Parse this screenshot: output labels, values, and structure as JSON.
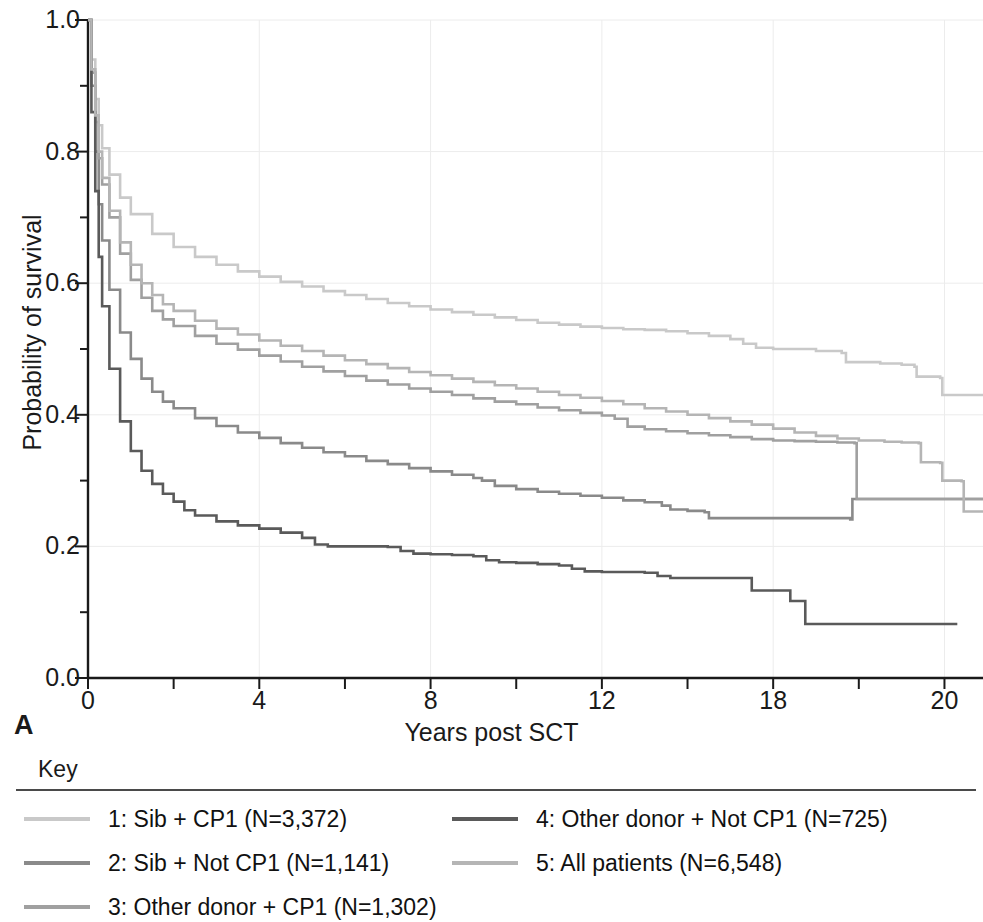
{
  "panel": {
    "label": "A"
  },
  "key": {
    "title": "Key"
  },
  "axes": {
    "xlabel": "Years post SCT",
    "ylabel": "Probability of survival",
    "xticks": [
      {
        "value": 0,
        "label": "0"
      },
      {
        "value": 4,
        "label": "4"
      },
      {
        "value": 8,
        "label": "8"
      },
      {
        "value": 12,
        "label": "12"
      },
      {
        "value": 16,
        "label": "18"
      },
      {
        "value": 20,
        "label": "20"
      }
    ],
    "yticks": [
      {
        "value": 0.0,
        "label": "0.0"
      },
      {
        "value": 0.2,
        "label": "0.2"
      },
      {
        "value": 0.4,
        "label": "0.4"
      },
      {
        "value": 0.6,
        "label": "0.6"
      },
      {
        "value": 0.8,
        "label": "0.8"
      },
      {
        "value": 1.0,
        "label": "1.0"
      }
    ],
    "xminor_step": 2,
    "yminor_step": 0.1
  },
  "chart_data": {
    "type": "line",
    "title": "",
    "subtitle": "",
    "xlabel": "Years post SCT",
    "ylabel": "Probability of survival",
    "xlim": [
      0,
      20.9
    ],
    "ylim": [
      0.0,
      1.0
    ],
    "grid": true,
    "grid_color": "#ececec",
    "legend_position": "below",
    "annotations": [
      "A"
    ],
    "series": [
      {
        "id": 1,
        "name": "1: Sib + CP1 (N=3,372)",
        "group": "Sib + CP1",
        "n": 3372,
        "color": "#c9c9c9",
        "points": [
          [
            0,
            1.0
          ],
          [
            0.08,
            0.94
          ],
          [
            0.17,
            0.88
          ],
          [
            0.25,
            0.84
          ],
          [
            0.33,
            0.805
          ],
          [
            0.5,
            0.765
          ],
          [
            0.75,
            0.73
          ],
          [
            1.0,
            0.705
          ],
          [
            1.5,
            0.675
          ],
          [
            2.0,
            0.655
          ],
          [
            2.5,
            0.64
          ],
          [
            3.0,
            0.628
          ],
          [
            3.5,
            0.618
          ],
          [
            4.0,
            0.61
          ],
          [
            4.5,
            0.602
          ],
          [
            5.0,
            0.595
          ],
          [
            5.5,
            0.588
          ],
          [
            6.0,
            0.582
          ],
          [
            6.5,
            0.576
          ],
          [
            7.0,
            0.57
          ],
          [
            7.5,
            0.565
          ],
          [
            8.0,
            0.56
          ],
          [
            8.5,
            0.556
          ],
          [
            9.0,
            0.552
          ],
          [
            9.5,
            0.548
          ],
          [
            10.0,
            0.544
          ],
          [
            10.5,
            0.54
          ],
          [
            11.0,
            0.537
          ],
          [
            11.5,
            0.534
          ],
          [
            12.0,
            0.532
          ],
          [
            12.5,
            0.53
          ],
          [
            13.0,
            0.529
          ],
          [
            13.5,
            0.527
          ],
          [
            14.0,
            0.524
          ],
          [
            14.5,
            0.52
          ],
          [
            15.0,
            0.515
          ],
          [
            15.3,
            0.508
          ],
          [
            15.6,
            0.502
          ],
          [
            16.0,
            0.5
          ],
          [
            17.0,
            0.497
          ],
          [
            17.6,
            0.494
          ],
          [
            17.7,
            0.48
          ],
          [
            18.5,
            0.478
          ],
          [
            19.0,
            0.476
          ],
          [
            19.3,
            0.473
          ],
          [
            19.35,
            0.458
          ],
          [
            19.9,
            0.456
          ],
          [
            19.95,
            0.43
          ],
          [
            20.9,
            0.43
          ]
        ]
      },
      {
        "id": 2,
        "name": "2: Sib + Not CP1 (N=1,141)",
        "group": "Sib + Not CP1",
        "n": 1141,
        "color": "#8a8a8a",
        "points": [
          [
            0,
            1.0
          ],
          [
            0.08,
            0.9
          ],
          [
            0.17,
            0.8
          ],
          [
            0.25,
            0.72
          ],
          [
            0.33,
            0.665
          ],
          [
            0.5,
            0.59
          ],
          [
            0.75,
            0.525
          ],
          [
            1.0,
            0.485
          ],
          [
            1.25,
            0.455
          ],
          [
            1.5,
            0.435
          ],
          [
            1.75,
            0.42
          ],
          [
            2.0,
            0.41
          ],
          [
            2.5,
            0.395
          ],
          [
            3.0,
            0.383
          ],
          [
            3.5,
            0.373
          ],
          [
            4.0,
            0.365
          ],
          [
            4.5,
            0.357
          ],
          [
            5.0,
            0.35
          ],
          [
            5.5,
            0.343
          ],
          [
            6.0,
            0.337
          ],
          [
            6.5,
            0.33
          ],
          [
            7.0,
            0.325
          ],
          [
            7.5,
            0.319
          ],
          [
            8.0,
            0.314
          ],
          [
            8.5,
            0.309
          ],
          [
            9.0,
            0.304
          ],
          [
            9.2,
            0.3
          ],
          [
            9.5,
            0.292
          ],
          [
            10.0,
            0.287
          ],
          [
            10.5,
            0.283
          ],
          [
            11.0,
            0.28
          ],
          [
            11.5,
            0.277
          ],
          [
            12.0,
            0.274
          ],
          [
            12.5,
            0.27
          ],
          [
            13.0,
            0.267
          ],
          [
            13.4,
            0.262
          ],
          [
            13.6,
            0.256
          ],
          [
            14.0,
            0.254
          ],
          [
            14.4,
            0.252
          ],
          [
            14.5,
            0.243
          ],
          [
            17.8,
            0.241
          ],
          [
            17.85,
            0.272
          ],
          [
            17.9,
            0.272
          ],
          [
            20.9,
            0.272
          ]
        ]
      },
      {
        "id": 3,
        "name": "3: Other donor + CP1 (N=1,302)",
        "group": "Other donor + CP1",
        "n": 1302,
        "color": "#a0a0a0",
        "points": [
          [
            0,
            1.0
          ],
          [
            0.08,
            0.92
          ],
          [
            0.17,
            0.845
          ],
          [
            0.25,
            0.79
          ],
          [
            0.33,
            0.75
          ],
          [
            0.5,
            0.7
          ],
          [
            0.75,
            0.645
          ],
          [
            1.0,
            0.605
          ],
          [
            1.25,
            0.578
          ],
          [
            1.5,
            0.558
          ],
          [
            1.75,
            0.545
          ],
          [
            2.0,
            0.535
          ],
          [
            2.5,
            0.52
          ],
          [
            3.0,
            0.508
          ],
          [
            3.5,
            0.499
          ],
          [
            4.0,
            0.49
          ],
          [
            4.5,
            0.481
          ],
          [
            5.0,
            0.473
          ],
          [
            5.5,
            0.466
          ],
          [
            6.0,
            0.459
          ],
          [
            6.5,
            0.452
          ],
          [
            7.0,
            0.446
          ],
          [
            7.5,
            0.44
          ],
          [
            8.0,
            0.435
          ],
          [
            8.5,
            0.43
          ],
          [
            9.0,
            0.425
          ],
          [
            9.5,
            0.42
          ],
          [
            10.0,
            0.416
          ],
          [
            10.5,
            0.411
          ],
          [
            11.0,
            0.407
          ],
          [
            11.5,
            0.403
          ],
          [
            12.0,
            0.399
          ],
          [
            12.3,
            0.394
          ],
          [
            12.6,
            0.382
          ],
          [
            13.0,
            0.378
          ],
          [
            13.5,
            0.375
          ],
          [
            14.0,
            0.372
          ],
          [
            14.5,
            0.369
          ],
          [
            15.0,
            0.366
          ],
          [
            15.5,
            0.363
          ],
          [
            16.0,
            0.361
          ],
          [
            16.5,
            0.36
          ],
          [
            17.0,
            0.359
          ],
          [
            17.5,
            0.358
          ],
          [
            17.9,
            0.357
          ],
          [
            17.95,
            0.272
          ],
          [
            18.5,
            0.272
          ],
          [
            20.3,
            0.272
          ],
          [
            20.9,
            0.272
          ]
        ]
      },
      {
        "id": 4,
        "name": "4: Other donor + Not CP1 (N=725)",
        "group": "Other donor + Not CP1",
        "n": 725,
        "color": "#5a5a5a",
        "points": [
          [
            0,
            1.0
          ],
          [
            0.08,
            0.86
          ],
          [
            0.17,
            0.74
          ],
          [
            0.25,
            0.64
          ],
          [
            0.33,
            0.565
          ],
          [
            0.5,
            0.47
          ],
          [
            0.75,
            0.39
          ],
          [
            1.0,
            0.345
          ],
          [
            1.25,
            0.315
          ],
          [
            1.5,
            0.295
          ],
          [
            1.75,
            0.28
          ],
          [
            2.0,
            0.268
          ],
          [
            2.25,
            0.255
          ],
          [
            2.5,
            0.247
          ],
          [
            3.0,
            0.238
          ],
          [
            3.5,
            0.232
          ],
          [
            4.0,
            0.227
          ],
          [
            4.5,
            0.221
          ],
          [
            5.0,
            0.213
          ],
          [
            5.3,
            0.203
          ],
          [
            5.6,
            0.2
          ],
          [
            6.0,
            0.2
          ],
          [
            6.5,
            0.2
          ],
          [
            7.0,
            0.199
          ],
          [
            7.3,
            0.193
          ],
          [
            7.6,
            0.189
          ],
          [
            8.0,
            0.188
          ],
          [
            8.5,
            0.187
          ],
          [
            9.0,
            0.185
          ],
          [
            9.3,
            0.179
          ],
          [
            9.6,
            0.176
          ],
          [
            10.0,
            0.175
          ],
          [
            10.5,
            0.173
          ],
          [
            11.0,
            0.171
          ],
          [
            11.3,
            0.166
          ],
          [
            11.6,
            0.162
          ],
          [
            12.0,
            0.161
          ],
          [
            12.6,
            0.161
          ],
          [
            13.0,
            0.16
          ],
          [
            13.3,
            0.155
          ],
          [
            13.6,
            0.152
          ],
          [
            14.0,
            0.152
          ],
          [
            14.5,
            0.152
          ],
          [
            15.0,
            0.152
          ],
          [
            15.4,
            0.152
          ],
          [
            15.5,
            0.133
          ],
          [
            16.3,
            0.133
          ],
          [
            16.4,
            0.117
          ],
          [
            16.7,
            0.117
          ],
          [
            16.75,
            0.082
          ],
          [
            17.5,
            0.082
          ],
          [
            19.6,
            0.082
          ],
          [
            20.3,
            0.082
          ]
        ]
      },
      {
        "id": 5,
        "name": "5: All patients (N=6,548)",
        "group": "All patients",
        "n": 6548,
        "color": "#b5b5b5",
        "points": [
          [
            0,
            1.0
          ],
          [
            0.08,
            0.925
          ],
          [
            0.17,
            0.855
          ],
          [
            0.25,
            0.8
          ],
          [
            0.33,
            0.76
          ],
          [
            0.5,
            0.71
          ],
          [
            0.75,
            0.662
          ],
          [
            1.0,
            0.628
          ],
          [
            1.25,
            0.6
          ],
          [
            1.5,
            0.582
          ],
          [
            1.75,
            0.568
          ],
          [
            2.0,
            0.558
          ],
          [
            2.5,
            0.543
          ],
          [
            3.0,
            0.531
          ],
          [
            3.5,
            0.522
          ],
          [
            4.0,
            0.513
          ],
          [
            4.5,
            0.505
          ],
          [
            5.0,
            0.497
          ],
          [
            5.5,
            0.49
          ],
          [
            6.0,
            0.483
          ],
          [
            6.5,
            0.477
          ],
          [
            7.0,
            0.471
          ],
          [
            7.5,
            0.465
          ],
          [
            8.0,
            0.46
          ],
          [
            8.5,
            0.455
          ],
          [
            9.0,
            0.45
          ],
          [
            9.5,
            0.445
          ],
          [
            10.0,
            0.44
          ],
          [
            10.5,
            0.435
          ],
          [
            11.0,
            0.43
          ],
          [
            11.5,
            0.426
          ],
          [
            12.0,
            0.421
          ],
          [
            12.5,
            0.416
          ],
          [
            13.0,
            0.41
          ],
          [
            13.5,
            0.405
          ],
          [
            14.0,
            0.4
          ],
          [
            14.5,
            0.395
          ],
          [
            15.0,
            0.39
          ],
          [
            15.5,
            0.385
          ],
          [
            16.0,
            0.379
          ],
          [
            16.5,
            0.373
          ],
          [
            17.0,
            0.368
          ],
          [
            17.5,
            0.364
          ],
          [
            18.0,
            0.361
          ],
          [
            18.6,
            0.359
          ],
          [
            19.0,
            0.358
          ],
          [
            19.4,
            0.357
          ],
          [
            19.45,
            0.328
          ],
          [
            19.9,
            0.327
          ],
          [
            19.95,
            0.3
          ],
          [
            20.4,
            0.299
          ],
          [
            20.45,
            0.253
          ],
          [
            20.9,
            0.253
          ]
        ]
      }
    ]
  },
  "legend": {
    "items": [
      {
        "label": "1: Sib + CP1 (N=3,372)",
        "color": "#c9c9c9",
        "col": 0,
        "row": 0
      },
      {
        "label": "2: Sib + Not CP1 (N=1,141)",
        "color": "#8a8a8a",
        "col": 0,
        "row": 1
      },
      {
        "label": "3: Other donor + CP1 (N=1,302)",
        "color": "#a0a0a0",
        "col": 0,
        "row": 2
      },
      {
        "label": "4: Other donor + Not CP1 (N=725)",
        "color": "#5a5a5a",
        "col": 1,
        "row": 0
      },
      {
        "label": "5: All patients (N=6,548)",
        "color": "#b5b5b5",
        "col": 1,
        "row": 1
      }
    ]
  }
}
